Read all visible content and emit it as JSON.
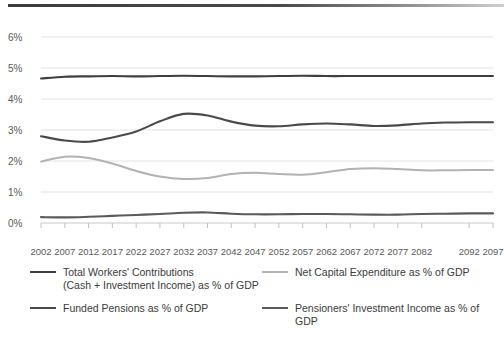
{
  "chart_data": {
    "type": "line",
    "title": "",
    "xlabel": "",
    "ylabel": "",
    "ylim": [
      0,
      6
    ],
    "yticks": [
      "0%",
      "1%",
      "2%",
      "3%",
      "4%",
      "5%",
      "6%"
    ],
    "ytick_values": [
      0,
      1,
      2,
      3,
      4,
      5,
      6
    ],
    "grid": true,
    "legend_position": "bottom",
    "xlim": [
      2002,
      2097
    ],
    "xtick_labels": [
      "2002",
      "2007",
      "2012",
      "2017",
      "2022",
      "2027",
      "2032",
      "2037",
      "2042",
      "2047",
      "2052",
      "2057",
      "2062",
      "2067",
      "2072",
      "2077",
      "2082",
      "2092",
      "2097"
    ],
    "xtick_values": [
      2002,
      2007,
      2012,
      2017,
      2022,
      2027,
      2032,
      2037,
      2042,
      2047,
      2052,
      2057,
      2062,
      2067,
      2072,
      2077,
      2082,
      2092,
      2097
    ],
    "x": [
      2002,
      2007,
      2012,
      2017,
      2022,
      2027,
      2032,
      2037,
      2042,
      2047,
      2052,
      2057,
      2062,
      2067,
      2072,
      2077,
      2082,
      2087,
      2092,
      2097
    ],
    "series": [
      {
        "name": "Total Workers' Contributions (Cash + Investment Income) as % of GDP",
        "color": "#3f3f3f",
        "values": [
          4.66,
          4.72,
          4.73,
          4.74,
          4.73,
          4.74,
          4.75,
          4.74,
          4.73,
          4.73,
          4.74,
          4.75,
          4.74,
          4.74,
          4.74,
          4.74,
          4.74,
          4.74,
          4.74,
          4.74
        ]
      },
      {
        "name": "Funded Pensions as % of GDP",
        "color": "#4a4a4a",
        "values": [
          2.8,
          2.66,
          2.62,
          2.76,
          2.95,
          3.28,
          3.52,
          3.47,
          3.27,
          3.14,
          3.12,
          3.18,
          3.21,
          3.18,
          3.13,
          3.15,
          3.21,
          3.24,
          3.25,
          3.25
        ]
      },
      {
        "name": "Net Capital Expenditure as % of GDP",
        "color": "#b3b3b3",
        "values": [
          1.98,
          2.14,
          2.1,
          1.92,
          1.68,
          1.5,
          1.42,
          1.45,
          1.58,
          1.62,
          1.58,
          1.56,
          1.64,
          1.74,
          1.77,
          1.74,
          1.7,
          1.7,
          1.71,
          1.71
        ]
      },
      {
        "name": "Pensioners' Investment Income as % of GDP",
        "color": "#5a5a5a",
        "values": [
          0.19,
          0.18,
          0.2,
          0.23,
          0.26,
          0.29,
          0.33,
          0.34,
          0.3,
          0.28,
          0.28,
          0.29,
          0.29,
          0.28,
          0.27,
          0.27,
          0.29,
          0.3,
          0.31,
          0.31
        ]
      }
    ]
  },
  "legend": {
    "items": [
      {
        "line1": "Total Workers' Contributions",
        "line2": "(Cash + Investment Income) as % of GDP",
        "color": "#3f3f3f"
      },
      {
        "line1": "Net Capital Expenditure as % of GDP",
        "line2": "",
        "color": "#b3b3b3"
      },
      {
        "line1": "Funded Pensions as % of GDP",
        "line2": "",
        "color": "#4a4a4a"
      },
      {
        "line1": "Pensioners' Investment Income as % of GDP",
        "line2": "",
        "color": "#5a5a5a"
      }
    ]
  }
}
